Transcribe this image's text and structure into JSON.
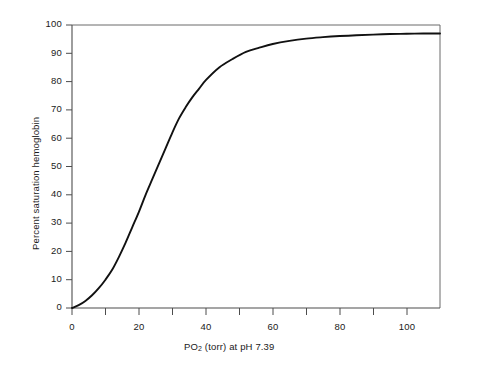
{
  "chart_data": {
    "type": "line",
    "title": "",
    "xlabel": "PO2 (torr) at pH 7.39",
    "xlabel_prefix": "PO",
    "xlabel_sub": "2",
    "xlabel_suffix": " (torr) at pH 7.39",
    "ylabel": "Percent saturation hemoglobin",
    "xlim": [
      0,
      110
    ],
    "ylim": [
      0,
      100
    ],
    "grid": false,
    "legend": "none",
    "x_tick_values": [
      0,
      10,
      20,
      30,
      40,
      50,
      60,
      70,
      80,
      90,
      100,
      110
    ],
    "x_tick_labels": [
      "0",
      "",
      "20",
      "",
      "40",
      "",
      "60",
      "",
      "80",
      "",
      "100",
      ""
    ],
    "y_tick_values": [
      0,
      10,
      20,
      30,
      40,
      50,
      60,
      70,
      80,
      90,
      100
    ],
    "y_tick_labels": [
      "0",
      "10",
      "20",
      "30",
      "40",
      "50",
      "60",
      "70",
      "80",
      "90",
      "100"
    ],
    "series": [
      {
        "name": "Oxyhemoglobin dissociation curve",
        "color": "#111111",
        "x": [
          0,
          2,
          4,
          6,
          8,
          10,
          12,
          14,
          16,
          18,
          20,
          22,
          24,
          26,
          28,
          30,
          32,
          34,
          36,
          38,
          40,
          44,
          48,
          52,
          56,
          60,
          65,
          70,
          75,
          80,
          85,
          90,
          95,
          100,
          105,
          110
        ],
        "values": [
          0,
          1,
          2.5,
          4.5,
          7,
          10,
          13.5,
          18,
          23,
          28.5,
          34,
          40,
          45.5,
          51,
          56.5,
          62,
          67,
          71,
          74.5,
          77.5,
          80.5,
          85,
          88,
          90.5,
          92,
          93.3,
          94.4,
          95.2,
          95.7,
          96.1,
          96.4,
          96.6,
          96.8,
          96.9,
          97,
          97
        ]
      }
    ],
    "annotations": {
      "p50_approx": 26,
      "plateau_percent": 97
    }
  },
  "axes": {
    "frame": "box",
    "axis_color": "#4d4d4d",
    "curve_color": "#111111"
  }
}
